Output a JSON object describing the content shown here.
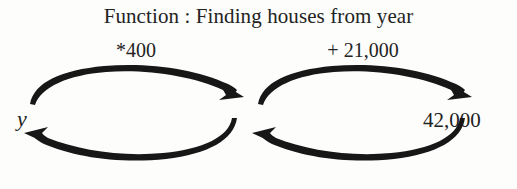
{
  "diagram": {
    "title": "Function : Finding houses from year",
    "type": "function-machine-flow",
    "nodes": [
      {
        "id": "input",
        "label": "y",
        "style": "italic"
      },
      {
        "id": "output",
        "label": "42,000",
        "style": "normal"
      }
    ],
    "operations": [
      {
        "id": "op-left",
        "label": "*400"
      },
      {
        "id": "op-right",
        "label": "+ 21,000"
      }
    ],
    "arrows": [
      {
        "id": "forward-left",
        "direction": "right",
        "position": "top-left",
        "from": "input",
        "to": "middle",
        "operation": "*400"
      },
      {
        "id": "reverse-left",
        "direction": "left",
        "position": "bottom-left",
        "from": "middle",
        "to": "input"
      },
      {
        "id": "forward-right",
        "direction": "right",
        "position": "top-right",
        "from": "middle",
        "to": "output",
        "operation": "+ 21,000"
      },
      {
        "id": "reverse-right",
        "direction": "left",
        "position": "bottom-right",
        "from": "output",
        "to": "middle"
      }
    ],
    "colors": {
      "ink": "#232323",
      "stroke": "#171717",
      "background": "#fdfdfb"
    }
  }
}
